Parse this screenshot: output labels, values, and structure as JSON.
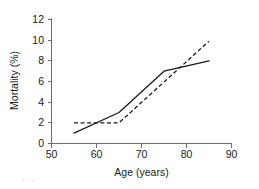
{
  "chart_data": {
    "type": "line",
    "title": "",
    "xlabel": "Age (years)",
    "ylabel": "Mortality (%)",
    "xlim": [
      50,
      90
    ],
    "ylim": [
      0,
      12
    ],
    "xticks": [
      50,
      60,
      70,
      80,
      90
    ],
    "yticks": [
      0,
      2,
      4,
      6,
      8,
      10,
      12
    ],
    "xtick_labels": [
      "50",
      "60",
      "70",
      "80",
      "90"
    ],
    "ytick_labels": [
      "0",
      "2",
      "4",
      "6",
      "8",
      "10",
      "12"
    ],
    "grid": false,
    "legend": "none",
    "series": [
      {
        "name": "observed",
        "style": "solid",
        "color": "#1a1a1a",
        "x": [
          55,
          65,
          75,
          85
        ],
        "values": [
          1.0,
          3.0,
          7.0,
          8.0
        ]
      },
      {
        "name": "fitted",
        "style": "dashed",
        "color": "#1a1a1a",
        "x": [
          55,
          65,
          85
        ],
        "values": [
          2.0,
          2.0,
          9.9
        ]
      }
    ]
  },
  "figure": {
    "caption_fragment": "·· ·"
  },
  "colors": {
    "axis": "#6e6e6e",
    "ink": "#1a1a1a",
    "background": "#ffffff"
  }
}
